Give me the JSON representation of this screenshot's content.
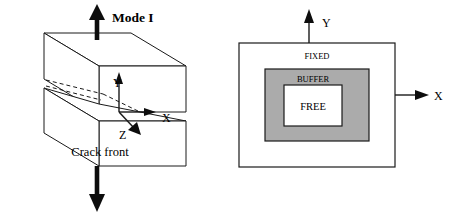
{
  "figure": {
    "background_color": "#ffffff",
    "ink_color": "#1a1a1a",
    "panels": [
      {
        "id": "mode-i-crack-specimen",
        "title": "Mode I"
      },
      {
        "id": "fixed-buffer-free-domain"
      }
    ]
  },
  "left_panel": {
    "mode_label": "Mode I",
    "axis_x": "X",
    "axis_y": "Y",
    "axis_z": "Z",
    "crack_label": "Crack front",
    "load_arrow_top": "arrow-up-icon",
    "load_arrow_bottom": "arrow-down-icon"
  },
  "right_panel": {
    "axis_x": "X",
    "axis_y": "Y",
    "regions": [
      {
        "name": "FIXED",
        "label": "FIXED",
        "fill": "#ffffff"
      },
      {
        "name": "BUFFER",
        "label": "BUFFER",
        "fill": "#ababab"
      },
      {
        "name": "FREE",
        "label": "FREE",
        "fill": "#ffffff"
      }
    ],
    "buffer_fill": "#ababab",
    "arrow_x": "arrow-right-icon",
    "arrow_y": "arrow-up-icon"
  }
}
